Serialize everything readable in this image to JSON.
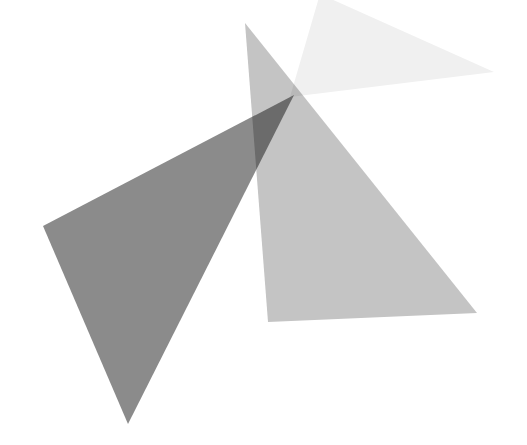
{
  "canvas": {
    "width": 527,
    "height": 445,
    "background_color": "#ffffff",
    "title": "Overlapping translucent triangles"
  },
  "palette": {
    "background": "#ffffff",
    "dark_gray": "#8b8b8b",
    "medium_gray": "#c4c4c4",
    "light_gray": "#f0f0f0",
    "darkest_overlap": "#6e6e6e",
    "mid_overlap": "#a8a8a8"
  },
  "chart_data": {
    "type": "scatter",
    "xlabel": "",
    "ylabel": "",
    "xlim": [
      0,
      527
    ],
    "ylim": [
      0,
      445
    ],
    "grid": false,
    "legend": "none",
    "series": [
      {
        "name": "dark-triangle",
        "shape": "triangle",
        "fill": "#8b8b8b",
        "opacity": 1,
        "points": [
          {
            "x": 294,
            "y": 95
          },
          {
            "x": 43,
            "y": 226
          },
          {
            "x": 128,
            "y": 424
          }
        ]
      },
      {
        "name": "medium-triangle",
        "shape": "triangle",
        "fill": "#c4c4c4",
        "opacity": 1,
        "points": [
          {
            "x": 245,
            "y": 23
          },
          {
            "x": 268,
            "y": 322
          },
          {
            "x": 477,
            "y": 313
          }
        ]
      },
      {
        "name": "light-triangle",
        "shape": "triangle",
        "fill": "#f0f0f0",
        "opacity": 1,
        "points": [
          {
            "x": 290,
            "y": 97
          },
          {
            "x": 320,
            "y": -6
          },
          {
            "x": 494,
            "y": 72
          }
        ]
      }
    ]
  }
}
